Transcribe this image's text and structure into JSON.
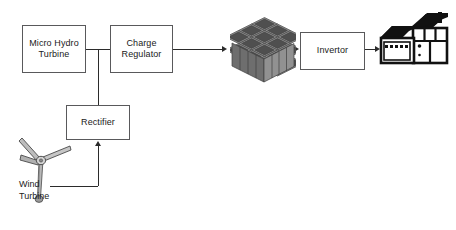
{
  "diagram": {
    "background": "#ffffff",
    "line_color": "#2b2b2b",
    "box_border_color": "#59595b",
    "text_color": "#1a1a1a"
  },
  "nodes": {
    "micro_hydro_turbine": {
      "label": "Micro Hydro\nTurbine"
    },
    "charge_regulator": {
      "label": "Charge\nRegulator"
    },
    "rectifier": {
      "label": "Rectifier"
    },
    "invertor": {
      "label": "Invertor"
    },
    "battery_bank": {
      "label": "Battery\nBank"
    },
    "wind_turbine": {
      "label": "Wind\nTurbine"
    }
  },
  "icons": {
    "battery_bank_icon": "battery-bank-isometric-stack-icon",
    "wind_turbine_icon": "wind-turbine-icon",
    "house_icon": "house-with-garage-icon"
  },
  "connections": [
    {
      "id": "micro-hydro-to-charge-regulator",
      "from": "micro_hydro_turbine",
      "to": "charge_regulator",
      "arrow": false
    },
    {
      "id": "junction-to-rectifier",
      "from": "micro_hydro_turbine",
      "to": "rectifier",
      "arrow": false
    },
    {
      "id": "charge-regulator-to-battery",
      "from": "charge_regulator",
      "to": "battery_bank",
      "arrow": true
    },
    {
      "id": "battery-to-invertor",
      "from": "battery_bank",
      "to": "invertor",
      "arrow": true
    },
    {
      "id": "invertor-to-house",
      "from": "invertor",
      "to": "house",
      "arrow": true
    },
    {
      "id": "wind-turbine-to-rectifier",
      "from": "wind_turbine",
      "to": "rectifier",
      "arrow": true
    }
  ]
}
